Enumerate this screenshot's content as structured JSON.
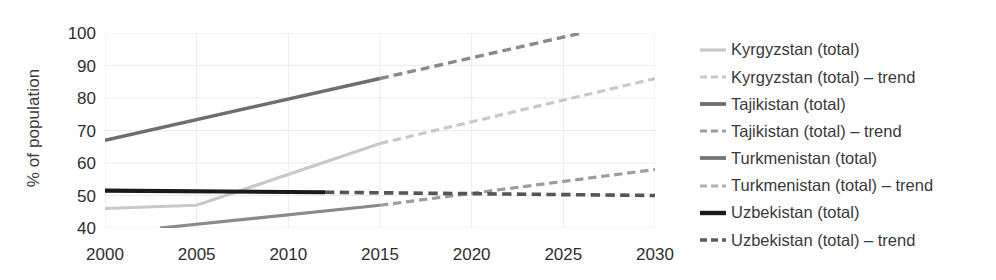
{
  "chart_data": {
    "type": "line",
    "title": "",
    "xlabel": "",
    "ylabel": "% of population",
    "xlim": [
      2000,
      2030
    ],
    "ylim": [
      40,
      100
    ],
    "xticks": [
      2000,
      2005,
      2010,
      2015,
      2020,
      2025,
      2030
    ],
    "yticks": [
      40,
      50,
      60,
      70,
      80,
      90,
      100
    ],
    "grid": "vertical-and-horizontal-light",
    "legend_position": "right",
    "series": [
      {
        "name": "Kyrgyzstan (total)",
        "style": "solid",
        "color": "#c9c9c9",
        "width": 3.2,
        "x": [
          2000,
          2005,
          2015
        ],
        "values": [
          46,
          47,
          66
        ]
      },
      {
        "name": "Kyrgyzstan (total) – trend",
        "style": "dashed",
        "color": "#c9c9c9",
        "width": 3.2,
        "x": [
          2015,
          2030
        ],
        "values": [
          66,
          86
        ]
      },
      {
        "name": "Tajikistan (total)",
        "style": "solid",
        "color": "#6e6e6e",
        "width": 3.4,
        "x": [
          2000,
          2015
        ],
        "values": [
          67,
          86
        ]
      },
      {
        "name": "Tajikistan (total) – trend",
        "style": "dashed",
        "color": "#8a8a8a",
        "width": 3.4,
        "x": [
          2015,
          2026
        ],
        "values": [
          86,
          100
        ]
      },
      {
        "name": "Turkmenistan (total)",
        "style": "solid",
        "color": "#8a8a8a",
        "width": 3.2,
        "x": [
          2003,
          2015
        ],
        "values": [
          40,
          47
        ]
      },
      {
        "name": "Turkmenistan (total) – trend",
        "style": "dashed",
        "color": "#9d9d9d",
        "width": 3.2,
        "x": [
          2015,
          2030
        ],
        "values": [
          47,
          58
        ]
      },
      {
        "name": "Uzbekistan (total)",
        "style": "solid",
        "color": "#1a1a1a",
        "width": 4.2,
        "x": [
          2000,
          2012
        ],
        "values": [
          51.5,
          51
        ]
      },
      {
        "name": "Uzbekistan (total) – trend",
        "style": "dashed",
        "color": "#555555",
        "width": 3.6,
        "x": [
          2012,
          2030
        ],
        "values": [
          51,
          50
        ]
      }
    ]
  },
  "axes": {
    "y_title": "% of population",
    "y_tick_labels": [
      "100",
      "90",
      "80",
      "70",
      "60",
      "50",
      "40"
    ],
    "x_tick_labels": [
      "2000",
      "2005",
      "2010",
      "2015",
      "2020",
      "2025",
      "2030"
    ]
  },
  "legend": {
    "items": [
      {
        "label": "Kyrgyzstan (total)",
        "color": "#c9c9c9",
        "style": "solid",
        "width": 3.2
      },
      {
        "label": "Kyrgyzstan (total) – trend",
        "color": "#c9c9c9",
        "style": "dashed",
        "width": 3.2
      },
      {
        "label": "Tajikistan (total)",
        "color": "#6e6e6e",
        "style": "solid",
        "width": 3.8
      },
      {
        "label": "Tajikistan (total) – trend",
        "color": "#9d9d9d",
        "style": "dashed",
        "width": 3.2
      },
      {
        "label": "Turkmenistan (total)",
        "color": "#757575",
        "style": "solid",
        "width": 3.8
      },
      {
        "label": "Turkmenistan (total) – trend",
        "color": "#b0b0b0",
        "style": "dashed",
        "width": 3.2
      },
      {
        "label": "Uzbekistan (total)",
        "color": "#1a1a1a",
        "style": "solid",
        "width": 4.4
      },
      {
        "label": "Uzbekistan (total) – trend",
        "color": "#5a5a5a",
        "style": "dashed",
        "width": 3.4
      }
    ]
  },
  "colors": {
    "grid": "#ebebeb",
    "text": "#2e2e2e",
    "background": "#ffffff"
  }
}
